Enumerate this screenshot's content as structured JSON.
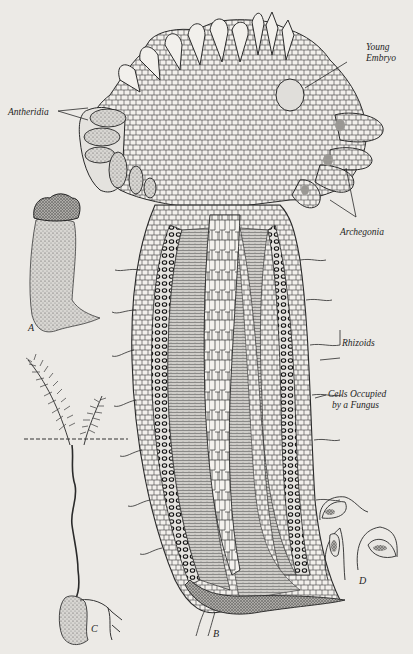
{
  "figure": {
    "background_color": "#eceae6",
    "ink_color": "#2a2a2a",
    "stipple_color": "#8a8a88",
    "labels": {
      "young_embryo_line1": "Young",
      "young_embryo_line2": "Embryo",
      "antheridia": "Antheridia",
      "archegonia": "Archegonia",
      "rhizoids": "Rhizoids",
      "cells_fungus_line1": "Cells Occupied",
      "cells_fungus_line2": "by a Fungus"
    },
    "panels": {
      "a": "A",
      "b": "B",
      "c": "C",
      "d": "D"
    }
  }
}
